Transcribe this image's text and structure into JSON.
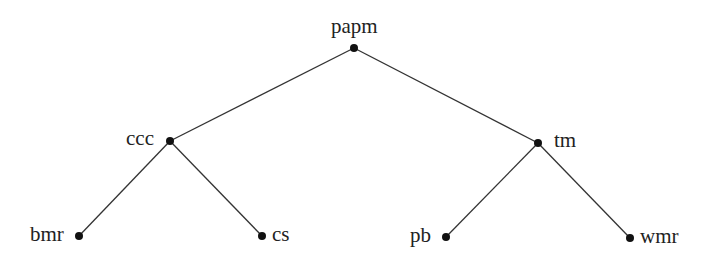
{
  "diagram": {
    "type": "tree",
    "nodes": [
      {
        "id": "papm",
        "label": "papm",
        "x": 354,
        "y": 48
      },
      {
        "id": "ccc",
        "label": "ccc",
        "x": 170,
        "y": 141
      },
      {
        "id": "tm",
        "label": "tm",
        "x": 538,
        "y": 143
      },
      {
        "id": "bmr",
        "label": "bmr",
        "x": 79,
        "y": 236
      },
      {
        "id": "cs",
        "label": "cs",
        "x": 262,
        "y": 236
      },
      {
        "id": "pb",
        "label": "pb",
        "x": 446,
        "y": 237
      },
      {
        "id": "wmr",
        "label": "wmr",
        "x": 630,
        "y": 238
      }
    ],
    "edges": [
      [
        "papm",
        "ccc"
      ],
      [
        "papm",
        "tm"
      ],
      [
        "ccc",
        "bmr"
      ],
      [
        "ccc",
        "cs"
      ],
      [
        "tm",
        "pb"
      ],
      [
        "tm",
        "wmr"
      ]
    ],
    "colors": {
      "line": "#333333",
      "node": "#111111",
      "text": "#222222"
    }
  }
}
